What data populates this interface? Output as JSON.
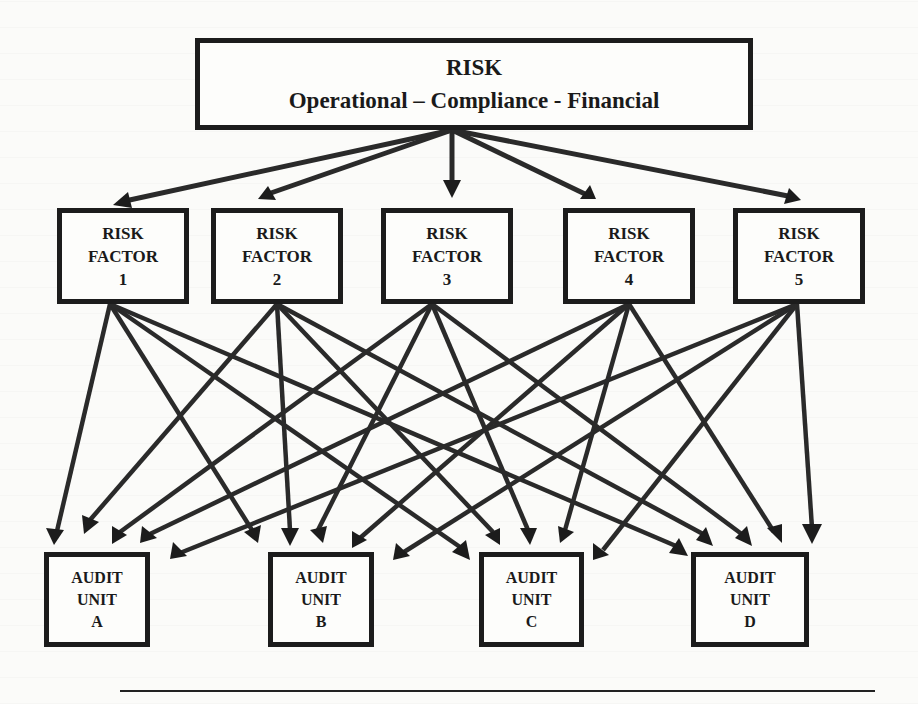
{
  "diagram": {
    "top_node": {
      "title": "RISK",
      "subtitle": "Operational – Compliance - Financial"
    },
    "risk_factors": [
      {
        "line1": "RISK",
        "line2": "FACTOR",
        "number": "1"
      },
      {
        "line1": "RISK",
        "line2": "FACTOR",
        "number": "2"
      },
      {
        "line1": "RISK",
        "line2": "FACTOR",
        "number": "3"
      },
      {
        "line1": "RISK",
        "line2": "FACTOR",
        "number": "4"
      },
      {
        "line1": "RISK",
        "line2": "FACTOR",
        "number": "5"
      }
    ],
    "audit_units": [
      {
        "line1": "AUDIT",
        "line2": "UNIT",
        "letter": "A"
      },
      {
        "line1": "AUDIT",
        "line2": "UNIT",
        "letter": "B"
      },
      {
        "line1": "AUDIT",
        "line2": "UNIT",
        "letter": "C"
      },
      {
        "line1": "AUDIT",
        "line2": "UNIT",
        "letter": "D"
      }
    ],
    "edges": {
      "risk_to_factors": [
        "RISK->RF1",
        "RISK->RF2",
        "RISK->RF3",
        "RISK->RF4",
        "RISK->RF5"
      ],
      "factors_to_units": "each of RF1-RF5 connects to each of Audit Units A-D (20 arrows)"
    },
    "colors": {
      "ink": "#1c1c1c",
      "paper": "#fbfbf9"
    }
  }
}
